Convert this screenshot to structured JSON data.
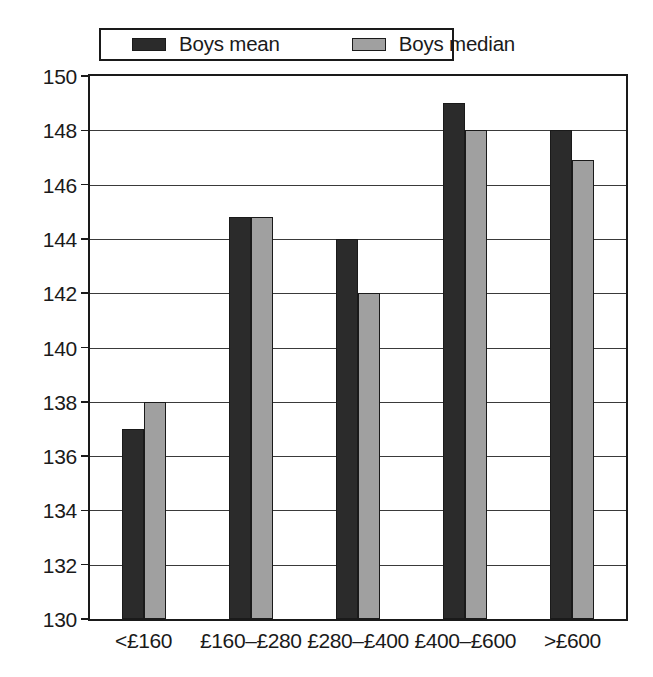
{
  "chart_data": {
    "type": "bar",
    "title": "",
    "subtitle": "",
    "xlabel": "",
    "ylabel": "",
    "categories": [
      "<£160",
      "£160–£280",
      "£280–£400",
      "£400–£600",
      ">£600"
    ],
    "series": [
      {
        "name": "Boys mean",
        "color": "#2b2b2b",
        "values": [
          137,
          144.8,
          144,
          149,
          148
        ]
      },
      {
        "name": "Boys median",
        "color": "#a0a0a0",
        "values": [
          138,
          144.8,
          142,
          148,
          146.9
        ]
      }
    ],
    "ylim": [
      130,
      150
    ],
    "ytick_step": 2,
    "yticks": [
      130,
      132,
      134,
      136,
      138,
      140,
      142,
      144,
      146,
      148,
      150
    ],
    "ytick_labels": [
      "130",
      "132",
      "134",
      "136",
      "138",
      "140",
      "142",
      "144",
      "146",
      "148",
      "150"
    ],
    "grid": true,
    "grid_axis": "y",
    "legend_position": "top-center",
    "bar_edge_color": "#1a1a1a",
    "frame_color": "#1a1a1a",
    "background": "#ffffff"
  },
  "legend": {
    "entries": [
      {
        "label": "Boys mean",
        "swatch_name": "legend-swatch-boys-mean",
        "color": "#2b2b2b"
      },
      {
        "label": "Boys median",
        "swatch_name": "legend-swatch-boys-median",
        "color": "#a0a0a0"
      }
    ]
  }
}
